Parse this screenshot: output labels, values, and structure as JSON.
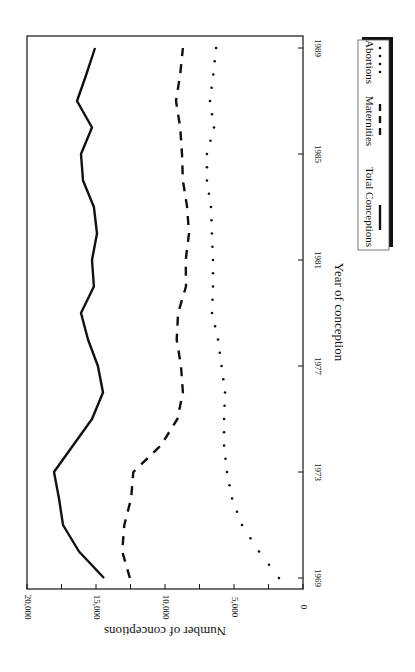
{
  "chart_data": {
    "type": "line",
    "orientation": "rotated-90-clockwise",
    "title": "",
    "xlabel": "Year of conception",
    "ylabel": "Number of conceptions",
    "xlim": [
      1969,
      1989
    ],
    "ylim": [
      0,
      20000
    ],
    "x_ticks": [
      1969,
      1973,
      1977,
      1981,
      1985,
      1989
    ],
    "x_tick_labels": [
      "1969",
      "1973",
      "1977",
      "1981",
      "1985",
      "1989"
    ],
    "y_ticks": [
      0,
      5000,
      10000,
      15000,
      20000
    ],
    "y_tick_labels": [
      "0",
      "5,000",
      "10,000",
      "15,000",
      "20,000"
    ],
    "y_minor_ticks": [
      2500,
      7500,
      12500,
      17500
    ],
    "grid": false,
    "legend_position": "below-right (boxed with drop shadow)",
    "x": [
      1969,
      1970,
      1971,
      1972,
      1973,
      1974,
      1975,
      1976,
      1977,
      1978,
      1979,
      1980,
      1981,
      1982,
      1983,
      1984,
      1985,
      1986,
      1987,
      1988,
      1989
    ],
    "series": [
      {
        "name": "Total Conceptions",
        "style": "solid",
        "color": "#111111",
        "values": [
          14420,
          16230,
          17390,
          17680,
          18040,
          16670,
          15290,
          14490,
          14860,
          15580,
          16090,
          15150,
          15290,
          14930,
          15150,
          15940,
          16090,
          15290,
          16380,
          15700,
          15070
        ]
      },
      {
        "name": "Maternities",
        "style": "dashed",
        "color": "#111111",
        "values": [
          12540,
          13100,
          12950,
          12460,
          12300,
          10300,
          9100,
          8700,
          8840,
          9150,
          9050,
          8480,
          8500,
          8260,
          8400,
          8700,
          8770,
          8900,
          9200,
          8900,
          8700
        ]
      },
      {
        "name": "Abortions",
        "style": "dotted",
        "color": "#111111",
        "values": [
          1740,
          3190,
          4420,
          5140,
          5510,
          5720,
          5720,
          5650,
          5900,
          6160,
          6590,
          6520,
          6520,
          6600,
          6670,
          6960,
          6960,
          6450,
          6740,
          6500,
          6300
        ]
      }
    ]
  },
  "labels": {
    "xlabel": "Year of conception",
    "ylabel": "Number of conceptions",
    "legend": [
      "Total Conceptions",
      "Maternities",
      "Abortions"
    ]
  }
}
